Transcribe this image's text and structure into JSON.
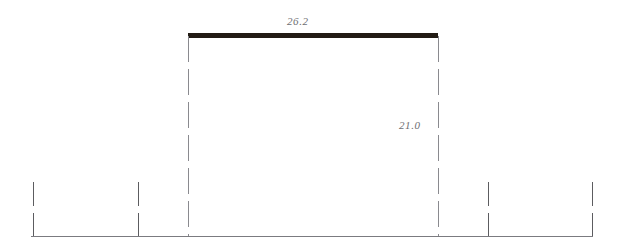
{
  "diagram": {
    "background_color": "#ffffff",
    "labels": {
      "top_span_label": "26.2",
      "right_height_label": "21.0"
    },
    "colors": {
      "beam": "#221b14",
      "baseline": "#7b7b80",
      "dimension_line": "#8a8a8f",
      "tick": "#5c5c60",
      "label_text": "#6e6e72"
    },
    "beam": {
      "x1": 188,
      "x2": 438,
      "y": 35,
      "thickness": 5,
      "label": "26.2"
    },
    "baseline": {
      "x1": 31,
      "x2": 593,
      "y": 236,
      "thickness": 1.6
    },
    "dimension_lines": [
      {
        "name": "left-extension-line",
        "x": 188,
        "y1": 36,
        "y2": 236,
        "dash": "26 7"
      },
      {
        "name": "right-extension-line",
        "x": 438,
        "y1": 36,
        "y2": 236,
        "dash": "26 7"
      }
    ],
    "ticks": [
      {
        "name": "tick-1",
        "x": 33,
        "segments": [
          [
            182,
            206
          ],
          [
            213,
            236
          ]
        ]
      },
      {
        "name": "tick-2",
        "x": 138,
        "segments": [
          [
            182,
            206
          ],
          [
            213,
            236
          ]
        ]
      },
      {
        "name": "tick-3",
        "x": 488,
        "segments": [
          [
            182,
            206
          ],
          [
            213,
            236
          ]
        ]
      },
      {
        "name": "tick-4",
        "x": 592,
        "segments": [
          [
            182,
            206
          ],
          [
            213,
            236
          ]
        ]
      }
    ]
  }
}
